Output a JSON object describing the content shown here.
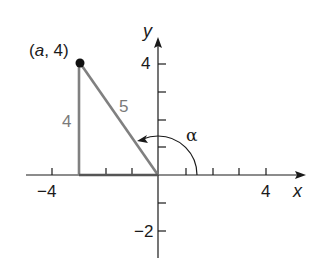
{
  "diagram": {
    "type": "coordinate-plane-triangle",
    "axes": {
      "x_label": "x",
      "y_label": "y",
      "x_tick_labels": [
        {
          "value": -4,
          "text": "−4"
        },
        {
          "value": 4,
          "text": "4"
        }
      ],
      "y_tick_labels": [
        {
          "value": 4,
          "text": "4"
        },
        {
          "value": -2,
          "text": "−2"
        }
      ],
      "x_ticks": [
        -4,
        -3,
        -2,
        -1,
        1,
        2,
        3,
        4
      ],
      "y_ticks": [
        4,
        3,
        2,
        1,
        -1,
        -2
      ]
    },
    "point": {
      "label": "(a, 4)",
      "label_prefix": "(",
      "label_var": "a",
      "label_suffix": ", 4)",
      "x": -3,
      "y": 4
    },
    "triangle": {
      "vertical_side_label": "4",
      "hypotenuse_label": "5"
    },
    "angle": {
      "label": "α"
    },
    "colors": {
      "axis": "#1a1a1a",
      "triangle_sides": "#808080",
      "base_leg": "#555555",
      "point": "#111111",
      "side_labels": "#7a7a7a"
    }
  }
}
